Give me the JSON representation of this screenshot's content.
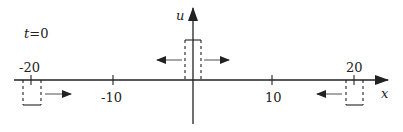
{
  "diagram": {
    "time_label": "t=0",
    "x_axis_label": "x",
    "u_axis_label": "u",
    "ticks": [
      {
        "value": "-20",
        "pos": "above"
      },
      {
        "value": "-10",
        "pos": "below"
      },
      {
        "value": "10",
        "pos": "below"
      },
      {
        "value": "20",
        "pos": "above"
      }
    ],
    "pulses": [
      {
        "name": "center-pulse",
        "center": 0,
        "direction": "both",
        "style": "dashed sides, solid top"
      },
      {
        "name": "left-pulse",
        "center": -20,
        "direction": "right",
        "style": "dashed sides, solid bottom"
      },
      {
        "name": "right-pulse",
        "center": 20,
        "direction": "left",
        "style": "dashed sides, solid bottom"
      }
    ],
    "colors": {
      "ink": "#222222",
      "background": "#ffffff"
    }
  }
}
